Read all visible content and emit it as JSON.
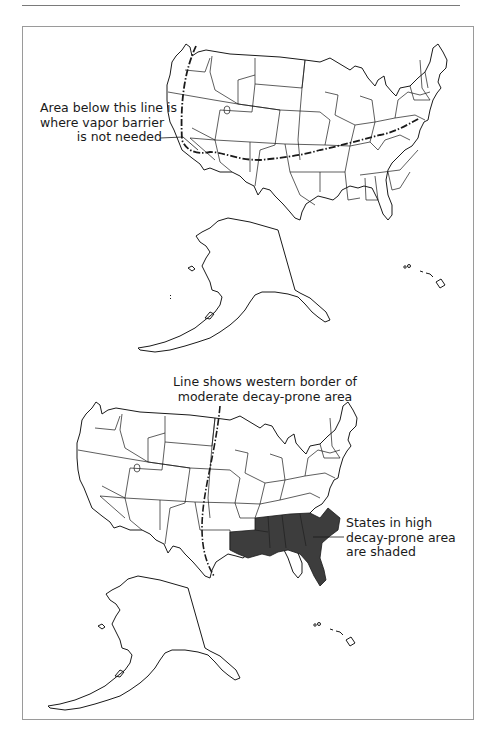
{
  "figure": {
    "top_map": {
      "callout": {
        "lines": [
          "Area below this line is",
          "where vapor barrier",
          "is not needed"
        ]
      },
      "line_style": "dash-dot"
    },
    "bottom_map": {
      "callout_line": {
        "lines": [
          "Line shows western border of",
          "moderate decay-prone area"
        ]
      },
      "callout_shaded": {
        "lines": [
          "States in high",
          "decay-prone area",
          "are shaded"
        ]
      },
      "shaded_states": [
        "Louisiana",
        "Mississippi",
        "Alabama",
        "Georgia",
        "South Carolina",
        "Florida"
      ],
      "shade_color": "#3d3d3d"
    }
  },
  "colors": {
    "outline": "#1a1a1a",
    "frame": "#9a9a9a",
    "background": "#ffffff"
  }
}
